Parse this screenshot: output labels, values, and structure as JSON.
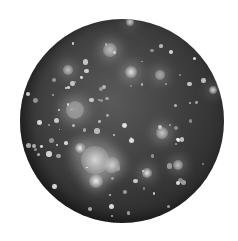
{
  "image": {
    "subject": "cratered moon",
    "background_color": "#ffffff",
    "palette": [
      "#2a2a2a",
      "#3e3e3e",
      "#5a5a5a",
      "#bdbdbd",
      "#f0f0f0"
    ]
  },
  "bright_regions": [
    {
      "x": 95,
      "y": 160,
      "r": 14,
      "color": "#d8d8d8"
    },
    {
      "x": 80,
      "y": 148,
      "r": 5,
      "color": "#f2f2f2"
    },
    {
      "x": 96,
      "y": 181,
      "r": 7,
      "color": "#eeeeee"
    },
    {
      "x": 112,
      "y": 165,
      "r": 8,
      "color": "#cfcfcf"
    },
    {
      "x": 110,
      "y": 50,
      "r": 7,
      "color": "#bdbdbd"
    },
    {
      "x": 131,
      "y": 72,
      "r": 6,
      "color": "#e2e2e2"
    },
    {
      "x": 75,
      "y": 110,
      "r": 9,
      "color": "#9a9a9a"
    },
    {
      "x": 162,
      "y": 133,
      "r": 6,
      "color": "#c8c8c8"
    },
    {
      "x": 147,
      "y": 173,
      "r": 5,
      "color": "#e8e8e8"
    },
    {
      "x": 68,
      "y": 70,
      "r": 5,
      "color": "#c0c0c0"
    },
    {
      "x": 213,
      "y": 90,
      "r": 4,
      "color": "#d8d8d8"
    },
    {
      "x": 160,
      "y": 75,
      "r": 5,
      "color": "#aaaaaa"
    },
    {
      "x": 130,
      "y": 22,
      "r": 4,
      "color": "#d0d0d0"
    },
    {
      "x": 178,
      "y": 165,
      "r": 5,
      "color": "#c0c0c0"
    }
  ]
}
